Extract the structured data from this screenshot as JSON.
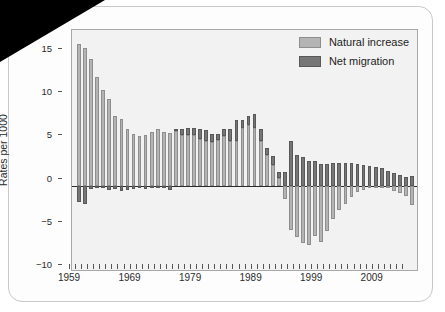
{
  "chart_data": {
    "type": "bar",
    "subtype": "stacked-bar-with-negatives",
    "title": "",
    "xlabel": "",
    "ylabel": "Rates per 1000",
    "ylim": [
      -10,
      18
    ],
    "yticks": [
      15,
      10,
      5,
      0,
      -5,
      -10
    ],
    "ytick_labels": [
      "15",
      "10",
      "5",
      "0",
      "−5",
      "−10"
    ],
    "xlim": [
      1959,
      2014
    ],
    "xticks": [
      1959,
      1969,
      1979,
      1989,
      1999,
      2009
    ],
    "xtick_labels": [
      "1959",
      "1969",
      "1979",
      "1989",
      "1999",
      "2009"
    ],
    "grid": false,
    "legend_position": "top-right",
    "legend": [
      {
        "label": "Natural increase",
        "color": "#b4b4b4"
      },
      {
        "label": "Net migration",
        "color": "#767676"
      }
    ],
    "x": [
      1959,
      1960,
      1961,
      1962,
      1963,
      1964,
      1965,
      1966,
      1967,
      1968,
      1969,
      1970,
      1971,
      1972,
      1973,
      1974,
      1975,
      1976,
      1977,
      1978,
      1979,
      1980,
      1981,
      1982,
      1983,
      1984,
      1985,
      1986,
      1987,
      1988,
      1989,
      1990,
      1991,
      1992,
      1993,
      1994,
      1995,
      1996,
      1997,
      1998,
      1999,
      2000,
      2001,
      2002,
      2003,
      2004,
      2005,
      2006,
      2007,
      2008,
      2009,
      2010,
      2011,
      2012,
      2013,
      2014
    ],
    "series": [
      {
        "name": "Natural increase",
        "color": "#b4b4b4",
        "values": [
          16.4,
          15.9,
          14.7,
          12.6,
          11.1,
          10.0,
          8.1,
          7.7,
          6.6,
          6.0,
          5.7,
          5.9,
          6.2,
          6.5,
          6.2,
          6.1,
          6.3,
          5.9,
          5.9,
          5.8,
          5.4,
          5.2,
          5.0,
          5.3,
          5.7,
          5.1,
          5.2,
          6.7,
          7.0,
          6.7,
          5.2,
          3.5,
          2.4,
          0.9,
          -1.5,
          -5.1,
          -6.0,
          -6.6,
          -6.9,
          -5.8,
          -6.5,
          -5.2,
          -3.9,
          -2.8,
          -2.1,
          -1.3,
          -0.8,
          -0.5,
          -0.3,
          -0.2,
          -0.2,
          -0.3,
          -0.6,
          -0.9,
          -1.2,
          -2.2
        ]
      },
      {
        "name": "Net migration",
        "color": "#767676",
        "values": [
          -1.9,
          -2.1,
          -0.4,
          -0.3,
          -0.3,
          -0.5,
          -0.4,
          -0.6,
          -0.5,
          -0.4,
          -0.2,
          -0.4,
          -0.3,
          -0.2,
          -0.3,
          -0.5,
          0.3,
          0.7,
          0.8,
          0.9,
          1.1,
          1.2,
          1.0,
          0.7,
          0.8,
          1.4,
          2.4,
          0.9,
          1.0,
          1.6,
          1.4,
          0.9,
          1.0,
          0.7,
          1.6,
          5.1,
          3.5,
          3.3,
          2.9,
          2.8,
          2.5,
          2.5,
          2.6,
          2.6,
          2.6,
          2.6,
          2.5,
          2.4,
          2.3,
          2.1,
          2.0,
          1.7,
          1.4,
          1.2,
          1.0,
          1.1
        ]
      }
    ]
  }
}
